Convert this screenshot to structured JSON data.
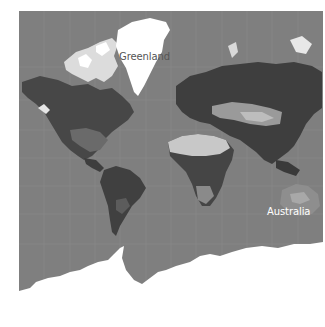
{
  "map": {
    "projection": "mercator",
    "style": "grayscale satellite",
    "colors": {
      "ocean": "#7f7f7f",
      "graticule": "#8e8e8e",
      "ice": "#ffffff",
      "land_dark": "#3c3c3c",
      "land_mid": "#5a5a5a",
      "desert": "#c8c8c8",
      "background": "#ffffff"
    },
    "labels": [
      {
        "id": "greenland",
        "text": "Greenland",
        "color": "#555555"
      },
      {
        "id": "australia",
        "text": "Australia",
        "color": "#ffffff"
      }
    ]
  }
}
